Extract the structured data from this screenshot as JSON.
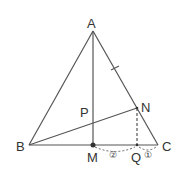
{
  "diagram": {
    "type": "geometry-triangle",
    "points": {
      "A": {
        "label": "A",
        "x": 93,
        "y": 31
      },
      "B": {
        "label": "B",
        "x": 29,
        "y": 145
      },
      "C": {
        "label": "C",
        "x": 158,
        "y": 145
      },
      "M": {
        "label": "M",
        "x": 93,
        "y": 145
      },
      "N": {
        "label": "N",
        "x": 137,
        "y": 108
      },
      "Q": {
        "label": "Q",
        "x": 137,
        "y": 145
      },
      "P": {
        "label": "P",
        "x": 93,
        "y": 124
      }
    },
    "segments": [
      {
        "from": "A",
        "to": "B",
        "style": "solid"
      },
      {
        "from": "A",
        "to": "C",
        "style": "solid"
      },
      {
        "from": "B",
        "to": "C",
        "style": "solid"
      },
      {
        "from": "A",
        "to": "M",
        "style": "solid"
      },
      {
        "from": "B",
        "to": "N",
        "style": "solid"
      },
      {
        "from": "N",
        "to": "Q",
        "style": "dashed"
      }
    ],
    "ratio_labels": {
      "MQ": "②",
      "QC": "①"
    },
    "tick_mark": "AN",
    "colors": {
      "line": "#555555",
      "text": "#333333"
    }
  }
}
